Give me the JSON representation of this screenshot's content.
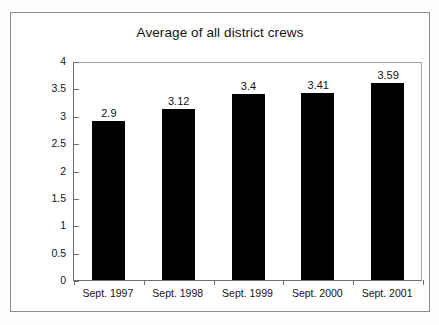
{
  "chart_data": {
    "type": "bar",
    "title": "Average of all district crews",
    "xlabel": "",
    "ylabel": "Productivity Units",
    "categories": [
      "Sept. 1997",
      "Sept. 1998",
      "Sept. 1999",
      "Sept. 2000",
      "Sept. 2001"
    ],
    "values": [
      2.9,
      3.12,
      3.4,
      3.41,
      3.59
    ],
    "value_labels": [
      "2.9",
      "3.12",
      "3.4",
      "3.41",
      "3.59"
    ],
    "ylim": [
      0,
      4
    ],
    "ytick_labels": [
      "0",
      "0.5",
      "1",
      "1.5",
      "2",
      "2.5",
      "3",
      "3.5",
      "4"
    ],
    "ytick_values": [
      0,
      0.5,
      1,
      1.5,
      2,
      2.5,
      3,
      3.5,
      4
    ],
    "grid": false,
    "legend": false,
    "bar_color": "#000000",
    "plot_background": "#ffffff",
    "axis_color": "#6e6e6e"
  }
}
